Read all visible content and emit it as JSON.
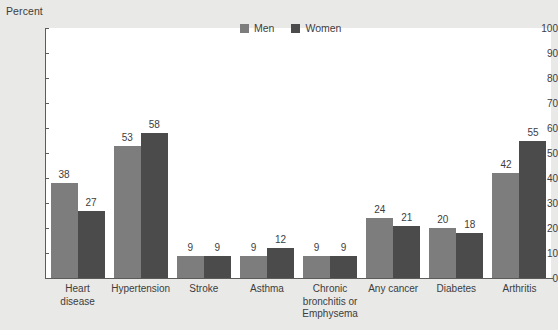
{
  "chart_data": {
    "type": "bar",
    "title": "",
    "xlabel": "",
    "ylabel": "Percent",
    "ylim": [
      0,
      100
    ],
    "ytick_step": 10,
    "yticks": [
      100,
      90,
      80,
      70,
      60,
      50,
      40,
      30,
      20,
      10,
      0
    ],
    "grid": false,
    "legend_position": "top-center",
    "categories": [
      "Heart disease",
      "Hypertension",
      "Stroke",
      "Asthma",
      "Chronic bronchitis or Emphysema",
      "Any cancer",
      "Diabetes",
      "Arthritis"
    ],
    "series": [
      {
        "name": "Men",
        "color": "#7d7d7d",
        "values": [
          38,
          53,
          9,
          9,
          9,
          24,
          20,
          42
        ]
      },
      {
        "name": "Women",
        "color": "#4b4b4b",
        "values": [
          27,
          58,
          9,
          12,
          9,
          21,
          18,
          55
        ]
      }
    ]
  },
  "axis": {
    "y_title": "Percent"
  },
  "legend": {
    "items": [
      {
        "label": "Men",
        "color": "#7d7d7d"
      },
      {
        "label": "Women",
        "color": "#4b4b4b"
      }
    ]
  },
  "colors": {
    "background": "#e9e9e7",
    "plot_background": "#ffffff",
    "axis_line": "#5c5c5c",
    "text": "#3d3d3d",
    "men": "#7d7d7d",
    "women": "#4b4b4b"
  }
}
